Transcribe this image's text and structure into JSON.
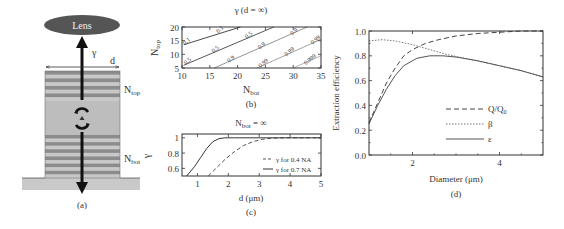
{
  "figure": {
    "panel_labels": {
      "a": "(a)",
      "b": "(b)",
      "c": "(c)",
      "d": "(d)"
    }
  },
  "panel_a": {
    "lens_label": "Lens",
    "gamma_label": "γ",
    "d_label": "d",
    "ntop_label": "N",
    "ntop_sub": "top",
    "nbot_label": "N",
    "nbot_sub": "bot",
    "colors": {
      "lens": "#555555",
      "dbr_dark": "#8c8c8c",
      "dbr_light": "#c8c8c8",
      "cavity": "#bdbdbd",
      "substrate": "#c9c9c9",
      "arrow": "#111111"
    },
    "top_dbr_pairs": 4,
    "bottom_dbr_pairs": 6
  },
  "chart_data": [
    {
      "panel": "b",
      "type": "contour",
      "title": "γ (d = ∞)",
      "xlabel": "N_bot",
      "ylabel": "N_top",
      "xlim": [
        10,
        35
      ],
      "ylim": [
        5,
        20
      ],
      "xticks": [
        10,
        15,
        20,
        25,
        30,
        35
      ],
      "yticks": [
        5,
        10,
        15,
        20
      ],
      "contours": [
        {
          "level": "0.1",
          "points": [
            [
              10.3,
              13.5
            ],
            [
              20.5,
              20
            ]
          ],
          "color": "#333333"
        },
        {
          "level": "0.5",
          "points": [
            [
              10.3,
              6.0
            ],
            [
              26.5,
              20
            ]
          ],
          "color": "#444444"
        },
        {
          "level": "0.9",
          "points": [
            [
              15.8,
              5.0
            ],
            [
              32.5,
              20
            ]
          ],
          "color": "#888888"
        },
        {
          "level": "0.99",
          "points": [
            [
              23.5,
              5.0
            ],
            [
              35,
              15.5
            ]
          ],
          "color": "#999999"
        },
        {
          "level": "0.999",
          "points": [
            [
              30.0,
              5.0
            ],
            [
              35,
              9.5
            ]
          ],
          "color": "#aaaaaa"
        }
      ],
      "contour_labels": [
        {
          "text": "0.1",
          "x": 11.0,
          "y": 14.3
        },
        {
          "text": "0.1",
          "x": 17.0,
          "y": 18.6
        },
        {
          "text": "0.5",
          "x": 11.2,
          "y": 7.0
        },
        {
          "text": "0.5",
          "x": 16.2,
          "y": 11.3
        },
        {
          "text": "0.5",
          "x": 22.2,
          "y": 16.5
        },
        {
          "text": "0.9",
          "x": 19.0,
          "y": 7.8
        },
        {
          "text": "0.9",
          "x": 24.5,
          "y": 12.7
        },
        {
          "text": "0.9",
          "x": 30.3,
          "y": 17.8
        },
        {
          "text": "0.99",
          "x": 24.8,
          "y": 6.3
        },
        {
          "text": "0.99",
          "x": 29.5,
          "y": 10.5
        },
        {
          "text": "0.99",
          "x": 34.2,
          "y": 14.8
        },
        {
          "text": "0.999",
          "x": 33.2,
          "y": 7.6
        }
      ]
    },
    {
      "panel": "c",
      "type": "line",
      "title": "N_bot = ∞",
      "xlabel": "d (μm)",
      "ylabel": "γ",
      "xlim": [
        0.5,
        5
      ],
      "ylim": [
        0.5,
        1.05
      ],
      "xticks": [
        1,
        2,
        3,
        4,
        5
      ],
      "yticks": [
        0.6,
        0.8,
        1
      ],
      "ytick_labels": [
        "0.6",
        "0.8",
        "1"
      ],
      "legend": {
        "position": "lower right"
      },
      "series": [
        {
          "name": "γ for 0.4 NA",
          "style": "dashed",
          "x": [
            1.35,
            1.6,
            1.9,
            2.2,
            2.5,
            2.8,
            3.1,
            3.4,
            3.8,
            4.5,
            5.0
          ],
          "y": [
            0.5,
            0.6,
            0.72,
            0.82,
            0.9,
            0.95,
            0.98,
            0.995,
            1.0,
            1.0,
            1.0
          ]
        },
        {
          "name": "γ for 0.7 NA",
          "style": "solid",
          "x": [
            0.65,
            0.9,
            1.1,
            1.3,
            1.5,
            1.7,
            1.9,
            2.2,
            3.0,
            5.0
          ],
          "y": [
            0.5,
            0.62,
            0.74,
            0.86,
            0.95,
            0.99,
            1.0,
            1.0,
            1.0,
            1.0
          ]
        }
      ]
    },
    {
      "panel": "d",
      "type": "line",
      "title": "",
      "xlabel": "Diameter (μm)",
      "ylabel": "Extraction efficiency",
      "xlim": [
        1,
        5
      ],
      "ylim": [
        0,
        1
      ],
      "xticks": [
        2,
        4
      ],
      "yticks": [
        0.0,
        0.2,
        0.4,
        0.6,
        0.8,
        1.0
      ],
      "ytick_labels": [
        "0.0",
        "0.2",
        "0.4",
        "0.6",
        "0.8",
        "1.0"
      ],
      "legend": {
        "position": "lower right"
      },
      "series": [
        {
          "name": "Q/Q0",
          "label_main": "Q/Q",
          "label_sub": "0",
          "style": "dashed",
          "x": [
            1.0,
            1.2,
            1.4,
            1.6,
            1.8,
            2.0,
            2.3,
            2.6,
            3.0,
            3.5,
            4.0,
            4.5,
            5.0
          ],
          "y": [
            0.26,
            0.42,
            0.58,
            0.7,
            0.8,
            0.85,
            0.9,
            0.93,
            0.96,
            0.98,
            0.99,
            1.0,
            1.0
          ]
        },
        {
          "name": "β",
          "label_main": "β",
          "label_sub": "",
          "style": "dotted",
          "x": [
            1.0,
            1.3,
            1.6,
            2.0,
            2.4,
            2.8,
            3.2,
            3.6,
            4.0,
            4.5,
            5.0
          ],
          "y": [
            0.92,
            0.93,
            0.92,
            0.89,
            0.85,
            0.81,
            0.78,
            0.75,
            0.72,
            0.68,
            0.63
          ]
        },
        {
          "name": "ε",
          "label_main": "ε",
          "label_sub": "",
          "style": "solid",
          "x": [
            1.0,
            1.2,
            1.4,
            1.6,
            1.8,
            2.1,
            2.4,
            2.7,
            3.0,
            3.5,
            4.0,
            4.5,
            5.0
          ],
          "y": [
            0.25,
            0.4,
            0.53,
            0.64,
            0.72,
            0.78,
            0.8,
            0.8,
            0.79,
            0.76,
            0.72,
            0.68,
            0.63
          ]
        }
      ]
    }
  ]
}
